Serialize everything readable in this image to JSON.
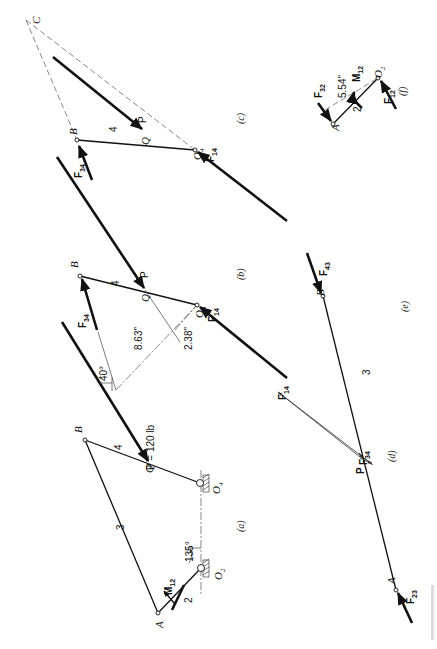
{
  "figure": {
    "caption_hint": "FIGURE (partially visible, rotated at bottom-right edge)"
  },
  "panels": {
    "a": {
      "caption": "(a)",
      "labels": {
        "A": "A",
        "B": "B",
        "Q": "Q",
        "O2": "O",
        "O2_sub": "2",
        "O4": "O",
        "O4_sub": "4",
        "link2": "2",
        "link3": "3",
        "link4": "4",
        "M12": "M",
        "M12_sub": "12",
        "angle_crank": "135°",
        "angle_force": "40°",
        "force": "P = 120 lb"
      }
    },
    "b": {
      "caption": "(b)",
      "labels": {
        "B": "B",
        "Q": "Q",
        "O4": "O",
        "O4_sub": "4",
        "link4": "4",
        "P": "P",
        "F34": "F",
        "F34_sub": "34",
        "F14": "F",
        "F14_sub": "14",
        "dim1": "8.63\"",
        "dim2": "2.38\""
      }
    },
    "c": {
      "caption": "(c)",
      "labels": {
        "C": "C",
        "B": "B",
        "Q": "Q",
        "O4": "O",
        "O4_sub": "4",
        "link4": "4",
        "P": "P",
        "F34": "F",
        "F34_sub": "34",
        "F14": "F",
        "F14_sub": "14"
      }
    },
    "d": {
      "caption": "(d)",
      "labels": {
        "F14": "F",
        "F14_sub": "14",
        "F34": "F",
        "F34_sub": "34",
        "P": "P"
      }
    },
    "e": {
      "caption": "(e)",
      "labels": {
        "A": "A",
        "B": "B",
        "link3": "3",
        "F43": "F",
        "F43_sub": "43",
        "F23": "F",
        "F23_sub": "23"
      }
    },
    "f": {
      "caption": "(f)",
      "labels": {
        "A": "A",
        "O2": "O",
        "O2_sub": "2",
        "link2": "2",
        "M12": "M",
        "M12_sub": "12",
        "F32": "F",
        "F32_sub": "32",
        "F12": "F",
        "F12_sub": "12",
        "dim": "5.54\""
      }
    }
  },
  "colors": {
    "ink": "#111111",
    "construction": "#555555",
    "background": "#ffffff"
  }
}
